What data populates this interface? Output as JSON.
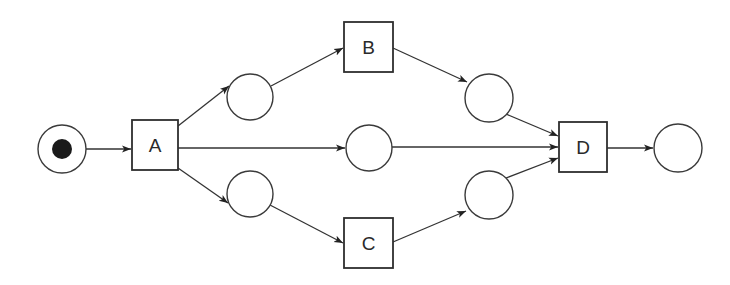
{
  "diagram": {
    "type": "petri-net",
    "colors": {
      "stroke": "#333333",
      "token": "#1a1a1a",
      "background": "#ffffff"
    },
    "places": [
      {
        "id": "start",
        "cx": 62,
        "cy": 149,
        "r": 24,
        "tokens": 1
      },
      {
        "id": "p1",
        "cx": 250,
        "cy": 97,
        "r": 23,
        "tokens": 0
      },
      {
        "id": "p2",
        "cx": 369,
        "cy": 148,
        "r": 23,
        "tokens": 0
      },
      {
        "id": "p3",
        "cx": 250,
        "cy": 194,
        "r": 23,
        "tokens": 0
      },
      {
        "id": "p4",
        "cx": 489,
        "cy": 98,
        "r": 24,
        "tokens": 0
      },
      {
        "id": "p5",
        "cx": 489,
        "cy": 195,
        "r": 24,
        "tokens": 0
      },
      {
        "id": "end",
        "cx": 678,
        "cy": 148,
        "r": 24,
        "tokens": 0
      }
    ],
    "transitions": [
      {
        "id": "A",
        "label": "A",
        "x": 132,
        "y": 120,
        "w": 46,
        "h": 50
      },
      {
        "id": "B",
        "label": "B",
        "x": 344,
        "y": 22,
        "w": 49,
        "h": 50
      },
      {
        "id": "C",
        "label": "C",
        "x": 344,
        "y": 218,
        "w": 49,
        "h": 50
      },
      {
        "id": "D",
        "label": "D",
        "x": 559,
        "y": 122,
        "w": 48,
        "h": 50
      }
    ],
    "arcs": [
      {
        "from": "start",
        "to": "A"
      },
      {
        "from": "A",
        "to": "p1"
      },
      {
        "from": "A",
        "to": "p2"
      },
      {
        "from": "A",
        "to": "p3"
      },
      {
        "from": "p1",
        "to": "B"
      },
      {
        "from": "p3",
        "to": "C"
      },
      {
        "from": "B",
        "to": "p4"
      },
      {
        "from": "C",
        "to": "p5"
      },
      {
        "from": "p4",
        "to": "D"
      },
      {
        "from": "p2",
        "to": "D"
      },
      {
        "from": "p5",
        "to": "D"
      },
      {
        "from": "D",
        "to": "end"
      }
    ]
  },
  "labels": {
    "A": "A",
    "B": "B",
    "C": "C",
    "D": "D"
  }
}
